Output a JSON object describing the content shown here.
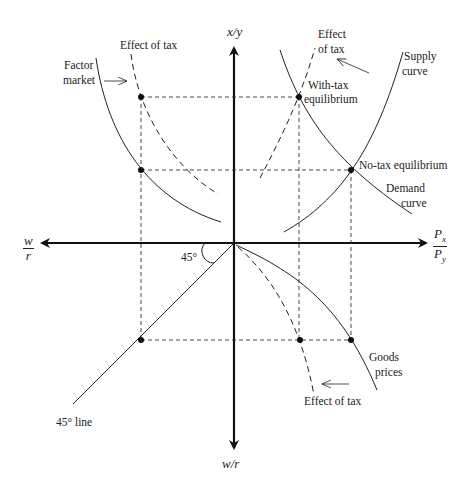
{
  "diagram": {
    "type": "four-quadrant economics diagram",
    "axes": {
      "up": "x/y",
      "down": "w/r",
      "left": {
        "num": "w",
        "den": "r"
      },
      "right": {
        "num": "P",
        "num_sub": "x",
        "den": "P",
        "den_sub": "y"
      }
    },
    "labels": {
      "factor_market": [
        "Factor",
        "market"
      ],
      "effect_of_tax_top_left": "Effect of tax",
      "effect_of_tax_top_right": [
        "Effect",
        "of tax"
      ],
      "supply_curve": [
        "Supply",
        "curve"
      ],
      "with_tax_equilibrium": [
        "With-tax",
        "equilibrium"
      ],
      "no_tax_equilibrium": "No-tax equilibrium",
      "demand_curve": [
        "Demand",
        "curve"
      ],
      "angle": "45°",
      "line_45": "45° line",
      "goods_prices": [
        "Goods",
        "prices"
      ],
      "effect_of_tax_bottom": "Effect of tax"
    },
    "colors": {
      "ink": "#222222",
      "background": "#ffffff"
    }
  }
}
